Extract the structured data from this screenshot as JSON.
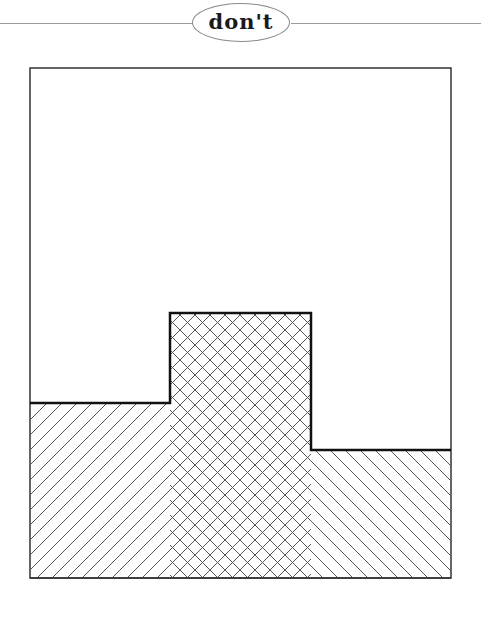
{
  "header": {
    "label": "don't"
  },
  "chart_data": {
    "type": "area",
    "title": "don't",
    "subtitle": "",
    "xlabel": "",
    "ylabel": "",
    "grid": false,
    "legend": "none",
    "frame": {
      "x": 30,
      "y": 68,
      "width": 421,
      "height": 510
    },
    "steps": [
      {
        "x_start": 30,
        "x_end": 170,
        "top_y": 403
      },
      {
        "x_start": 170,
        "x_end": 311,
        "top_y": 313
      },
      {
        "x_start": 311,
        "x_end": 451,
        "top_y": 450
      }
    ],
    "categories": [
      "left",
      "middle",
      "right"
    ],
    "values": [
      175,
      265,
      128
    ],
    "series": [
      {
        "name": "forward-hatch region",
        "pattern": "/",
        "x_range": [
          30,
          311
        ]
      },
      {
        "name": "back-hatch region",
        "pattern": "\\",
        "x_range": [
          170,
          451
        ]
      }
    ],
    "ylim": [
      0,
      510
    ],
    "colors": {
      "outline": "#111111",
      "frame": "#333333",
      "hatch": "#555555",
      "background": "#ffffff"
    }
  }
}
